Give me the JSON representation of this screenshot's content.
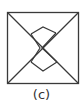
{
  "figure": {
    "label": "(c)",
    "stroke_color": "#3a3a3a",
    "background": "#ffffff",
    "square": {
      "x": 7,
      "y": 12,
      "size": 71
    },
    "diagonals": [
      [
        7,
        12,
        78,
        83
      ],
      [
        78,
        12,
        7,
        83
      ]
    ],
    "inner_shape_points": [
      [
        43,
        27
      ],
      [
        55,
        33
      ],
      [
        43,
        50
      ],
      [
        58,
        62
      ],
      [
        43,
        71
      ],
      [
        31,
        62
      ],
      [
        40,
        50
      ],
      [
        32,
        35
      ]
    ]
  }
}
